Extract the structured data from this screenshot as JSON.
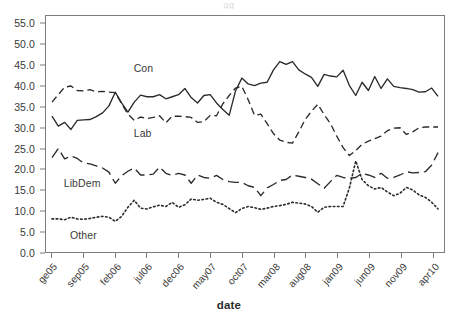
{
  "title_remnant": "gg",
  "caption_remnant": "",
  "chart_data": {
    "type": "line",
    "title": "",
    "xlabel": "date",
    "ylabel": "",
    "ylim": [
      0.0,
      57.0
    ],
    "ytick_values": [
      0.0,
      5.0,
      10.0,
      15.0,
      20.0,
      25.0,
      30.0,
      35.0,
      40.0,
      45.0,
      50.0,
      55.0
    ],
    "ytick_labels": [
      "0.0",
      "5.0",
      "10.0",
      "15.0",
      "20.0",
      "25.0",
      "30.0",
      "35.0",
      "40.0",
      "45.0",
      "50.0",
      "55.0"
    ],
    "xtick_labels": [
      "ge05",
      "sep05",
      "feb06",
      "jul06",
      "dec06",
      "may07",
      "oct07",
      "mar08",
      "aug08",
      "jan09",
      "jun09",
      "nov09",
      "apr10"
    ],
    "xtick_indices": [
      0,
      5,
      10,
      15,
      20,
      25,
      30,
      35,
      40,
      45,
      50,
      55,
      60
    ],
    "n_points": 62,
    "grid": false,
    "legend_position": "inline-annotations",
    "annotations": [
      {
        "text": "Con",
        "x_index": 13,
        "y_value": 44.0
      },
      {
        "text": "Lab",
        "x_index": 13,
        "y_value": 28.5
      },
      {
        "text": "LibDem",
        "x_index": 2,
        "y_value": 16.5
      },
      {
        "text": "Other",
        "x_index": 3,
        "y_value": 4.0
      }
    ],
    "series": [
      {
        "name": "Con",
        "style": "solid",
        "color": "#2b2b2b",
        "values": [
          32.8,
          30.4,
          31.3,
          29.6,
          31.8,
          31.9,
          32.0,
          32.7,
          33.6,
          35.3,
          38.6,
          36.0,
          33.8,
          36.2,
          37.9,
          37.5,
          37.5,
          38.0,
          37.0,
          37.5,
          38.0,
          39.5,
          37.3,
          36.0,
          37.8,
          38.0,
          36.0,
          34.4,
          33.0,
          38.9,
          42.0,
          40.6,
          40.2,
          40.8,
          41.0,
          44.0,
          46.0,
          45.3,
          46.0,
          44.0,
          43.0,
          42.2,
          40.0,
          42.9,
          42.5,
          42.3,
          43.9,
          40.2,
          37.8,
          41.0,
          39.0,
          42.4,
          39.5,
          41.8,
          40.0,
          39.7,
          39.5,
          39.2,
          38.6,
          38.7,
          39.6,
          37.6
        ]
      },
      {
        "name": "Lab",
        "style": "dashed",
        "color": "#2b2b2b",
        "values": [
          36.2,
          38.0,
          39.8,
          40.1,
          39.0,
          38.9,
          39.2,
          38.7,
          38.8,
          38.6,
          38.5,
          35.8,
          33.3,
          31.8,
          32.6,
          32.2,
          32.5,
          32.9,
          31.2,
          32.8,
          32.8,
          32.7,
          32.5,
          31.3,
          31.5,
          33.0,
          32.9,
          35.8,
          37.8,
          39.6,
          40.0,
          36.8,
          33.0,
          33.3,
          31.0,
          28.6,
          27.0,
          26.5,
          26.3,
          29.0,
          32.0,
          34.0,
          35.7,
          33.2,
          31.0,
          28.0,
          25.2,
          23.3,
          24.5,
          26.0,
          26.8,
          27.4,
          28.0,
          29.3,
          29.9,
          30.0,
          28.4,
          29.0,
          30.0,
          30.2,
          30.2,
          30.2
        ]
      },
      {
        "name": "LibDem",
        "style": "longdash",
        "color": "#2b2b2b",
        "values": [
          22.8,
          25.0,
          22.5,
          23.2,
          22.6,
          21.5,
          21.3,
          20.8,
          20.3,
          19.3,
          16.6,
          18.4,
          19.5,
          20.3,
          18.6,
          18.6,
          18.8,
          20.5,
          19.0,
          18.5,
          19.0,
          18.6,
          16.6,
          18.6,
          18.0,
          17.8,
          18.5,
          17.5,
          17.0,
          16.8,
          16.8,
          16.0,
          15.6,
          13.6,
          15.5,
          16.3,
          17.3,
          17.5,
          18.6,
          18.3,
          18.0,
          17.6,
          16.5,
          15.4,
          17.0,
          18.5,
          18.0,
          17.8,
          18.0,
          19.0,
          18.6,
          18.0,
          19.0,
          17.8,
          18.0,
          18.6,
          19.4,
          19.1,
          19.2,
          19.4,
          21.0,
          24.0
        ]
      },
      {
        "name": "Other",
        "style": "dotted",
        "color": "#2b2b2b",
        "values": [
          8.0,
          8.0,
          7.8,
          8.4,
          8.0,
          7.9,
          8.1,
          8.4,
          8.6,
          8.4,
          7.4,
          8.6,
          10.8,
          12.5,
          10.6,
          10.4,
          10.9,
          11.3,
          11.0,
          12.0,
          10.8,
          11.4,
          12.8,
          12.5,
          12.7,
          13.0,
          12.0,
          11.5,
          10.5,
          9.5,
          10.5,
          11.0,
          10.7,
          10.3,
          10.6,
          11.0,
          11.2,
          11.5,
          12.0,
          11.8,
          11.6,
          11.0,
          9.6,
          10.8,
          11.0,
          11.0,
          11.0,
          15.5,
          22.0,
          17.5,
          16.0,
          15.2,
          15.6,
          14.5,
          13.6,
          14.2,
          15.6,
          15.0,
          13.8,
          13.2,
          12.0,
          10.4
        ]
      }
    ]
  }
}
